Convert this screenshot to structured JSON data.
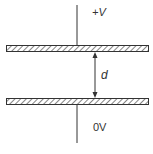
{
  "diagram": {
    "type": "parallel-plate-capacitor",
    "top_label": "+V",
    "gap_label": "d",
    "bottom_label": "0V",
    "colors": {
      "line": "#333333",
      "background": "#ffffff"
    }
  }
}
